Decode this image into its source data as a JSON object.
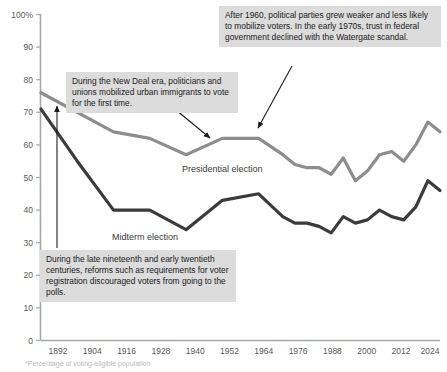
{
  "chart_data": {
    "type": "line",
    "title": "",
    "subtitle": "",
    "xlabel": "",
    "ylabel": "",
    "ylim": [
      0,
      100
    ],
    "xlim": [
      1892,
      2024
    ],
    "grid": false,
    "legend_position": "inline-labels",
    "y_ticks": [
      "100%",
      "90",
      "80",
      "70",
      "60",
      "50",
      "40",
      "30",
      "20",
      "10",
      "0"
    ],
    "y_tick_values": [
      100,
      90,
      80,
      70,
      60,
      50,
      40,
      30,
      20,
      10,
      0
    ],
    "x_ticks": [
      "1892",
      "1904",
      "1916",
      "1928",
      "1940",
      "1952",
      "1964",
      "1976",
      "1988",
      "2000",
      "2012",
      "2024"
    ],
    "x_tick_values": [
      1892,
      1904,
      1916,
      1928,
      1940,
      1952,
      1964,
      1976,
      1988,
      2000,
      2012,
      2024
    ],
    "series": [
      {
        "name": "Presidential election",
        "color": "#8d8d8d",
        "x": [
          1892,
          1904,
          1916,
          1928,
          1940,
          1952,
          1964,
          1972,
          1976,
          1980,
          1984,
          1988,
          1992,
          1996,
          2000,
          2004,
          2008,
          2012,
          2016,
          2020,
          2024
        ],
        "values": [
          76,
          70,
          64,
          62,
          57,
          62,
          62,
          57,
          54,
          53,
          53,
          51,
          56,
          49,
          52,
          57,
          58,
          55,
          60,
          67,
          64
        ]
      },
      {
        "name": "Midterm election",
        "color": "#3b3b3b",
        "x": [
          1892,
          1904,
          1916,
          1928,
          1940,
          1952,
          1964,
          1972,
          1976,
          1980,
          1984,
          1988,
          1992,
          1996,
          2000,
          2004,
          2008,
          2012,
          2016,
          2020,
          2024
        ],
        "values": [
          71,
          55,
          40,
          40,
          34,
          43,
          45,
          38,
          36,
          36,
          35,
          33,
          38,
          36,
          37,
          40,
          38,
          37,
          41,
          49,
          46
        ]
      }
    ],
    "series_labels": [
      {
        "name": "Presidential election",
        "x_px": 182,
        "y_px": 172
      },
      {
        "name": "Midterm election",
        "x_px": 112,
        "y_px": 240
      }
    ],
    "annotations": [
      {
        "id": "new-deal",
        "text": "During the New Deal era, politicians and unions mobilized urban immigrants to vote for the first time."
      },
      {
        "id": "parties-weaker",
        "text": "After 1960, political parties grew weaker and less likely to mobilize voters. In the early 1970s, trust in federal government declined with the Watergate scandal."
      },
      {
        "id": "registration-reforms",
        "text": "During the late nineteenth and early twentieth centuries, reforms such as requirements for voter registration discouraged voters from going to the polls."
      }
    ],
    "footnote": "*Percentage of voting-eligible population",
    "colors": {
      "presidential_line": "#8d8d8d",
      "midterm_line": "#3b3b3b",
      "axis": "#a7a7a7",
      "annotation_background": "#dcdcdc",
      "arrow": "#1a1a1a"
    }
  }
}
